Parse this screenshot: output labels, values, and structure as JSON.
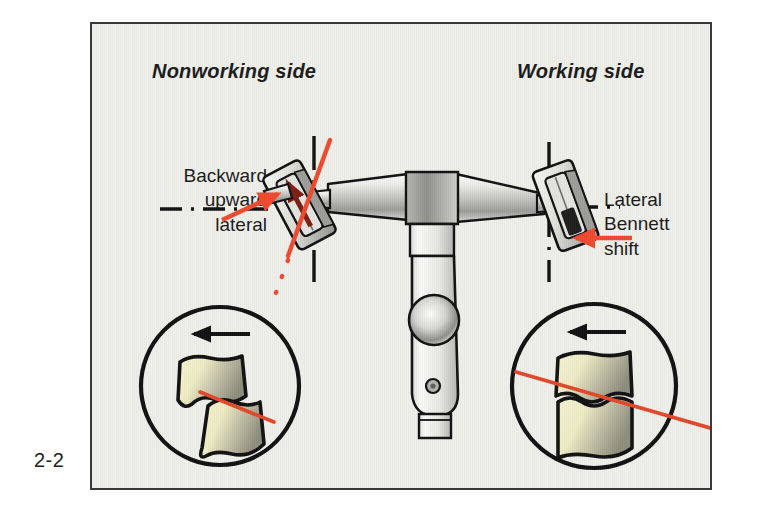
{
  "figure": {
    "number": "2-2",
    "caption_present": false
  },
  "panel": {
    "background_color": "#efefea",
    "border_color": "#3a3a38"
  },
  "headings": [
    {
      "id": "nonworking",
      "text": "Nonworking side"
    },
    {
      "id": "working",
      "text": "Working side"
    }
  ],
  "callouts": [
    {
      "id": "backward-upward-lateral",
      "lines": [
        "Backward",
        "upward",
        "lateral"
      ],
      "text": "Backward upward lateral",
      "side": "nonworking",
      "arrow_color": "#f0492e",
      "arrow_direction": "up-right"
    },
    {
      "id": "lateral-bennett-shift",
      "lines": [
        "Lateral",
        "Bennett",
        "shift"
      ],
      "text": "Lateral Bennett shift",
      "side": "working",
      "arrow_color": "#f0492e",
      "arrow_direction": "left"
    }
  ],
  "device": {
    "name": "dental-articulator",
    "parts": [
      "left-condylar-housing",
      "right-condylar-housing",
      "upper-crossbar",
      "central-vertical-stem",
      "adjustment-knob",
      "locking-screw",
      "stem-foot"
    ],
    "metal_light": "#f2f2f0",
    "metal_mid": "#b9b9b6",
    "metal_dark": "#7c7c79",
    "outline": "#111111"
  },
  "reference_lines": {
    "horizontal_style": "dash-dot",
    "vertical_style": "dash-dot",
    "color": "#111111",
    "movement_path_color": "#f0492e"
  },
  "insets": [
    {
      "id": "nonworking-inset",
      "side": "nonworking",
      "arrow_direction": "left",
      "arrow_color": "#111111",
      "teeth_state": "cusps-separated",
      "guide_line_color": "#e2472a",
      "tooth_fill_light": "#f2efc9",
      "tooth_fill_dark": "#9a9a86"
    },
    {
      "id": "working-inset",
      "side": "working",
      "arrow_direction": "left",
      "arrow_color": "#111111",
      "teeth_state": "cusps-in-contact",
      "guide_line_color": "#e2472a",
      "tooth_fill_light": "#f2efc9",
      "tooth_fill_dark": "#9a9a86"
    }
  ],
  "colors": {
    "red_accent": "#f0492e",
    "red_line": "#e2472a",
    "text": "#1a1a1a",
    "outline": "#111111"
  }
}
